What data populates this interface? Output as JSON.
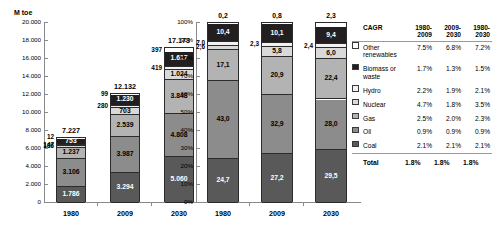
{
  "colors": {
    "other_renewables": "#ffffff",
    "biomass": "#231f20",
    "hydro": "#f2f2f2",
    "nuclear": "#d9d9d9",
    "gas": "#b3b3b3",
    "oil": "#8c8c8c",
    "coal": "#595959",
    "axis": "#8a8a8a",
    "outline": "#2b2b2b"
  },
  "chart_data": [
    {
      "type": "bar",
      "id": "absolute-stacked-bar",
      "title": "",
      "ylabel": "M toe",
      "xlabel": "",
      "categories": [
        "1980",
        "2009",
        "2030"
      ],
      "ylim": [
        0,
        20000
      ],
      "ytick_labels": [
        "0",
        "2.000",
        "4.000",
        "6.000",
        "8.000",
        "10.000",
        "12.000",
        "14.000",
        "16.000",
        "18.000",
        "20.000"
      ],
      "ytick_values": [
        0,
        2000,
        4000,
        6000,
        8000,
        10000,
        12000,
        14000,
        16000,
        18000,
        20000
      ],
      "grid": false,
      "legend": "external-table",
      "stack_order_bottom_to_top": [
        "Coal",
        "Oil",
        "Gas",
        "Nuclear",
        "Hydro",
        "Biomass or waste",
        "Other renewables"
      ],
      "series": [
        {
          "name": "Coal",
          "values": [
            1786,
            3294,
            5060
          ],
          "labels": [
            "1.786",
            "3.294",
            "5.060"
          ],
          "label_pos": [
            "inside",
            "inside",
            "inside"
          ]
        },
        {
          "name": "Oil",
          "values": [
            3106,
            3987,
            4808
          ],
          "labels": [
            "3.106",
            "3.987",
            "4.808"
          ],
          "label_pos": [
            "inside",
            "inside",
            "inside"
          ]
        },
        {
          "name": "Gas",
          "values": [
            1237,
            2539,
            3848
          ],
          "labels": [
            "1.237",
            "2.539",
            "3.848"
          ],
          "label_pos": [
            "inside",
            "inside",
            "inside"
          ]
        },
        {
          "name": "Nuclear",
          "values": [
            186,
            703,
            1024
          ],
          "labels": [
            "186",
            "703",
            "1.024"
          ],
          "label_pos": [
            "outside",
            "inside",
            "inside"
          ]
        },
        {
          "name": "Hydro",
          "values": [
            147,
            280,
            419
          ],
          "labels": [
            "147",
            "280",
            "419"
          ],
          "label_pos": [
            "outside",
            "outside",
            "outside"
          ]
        },
        {
          "name": "Biomass or waste",
          "values": [
            753,
            1230,
            1617
          ],
          "labels": [
            "753",
            "1.230",
            "1.617"
          ],
          "label_pos": [
            "inside",
            "inside",
            "inside"
          ]
        },
        {
          "name": "Other renewables",
          "values": [
            12,
            99,
            397
          ],
          "labels": [
            "12",
            "99",
            "397"
          ],
          "label_pos": [
            "outside",
            "outside",
            "outside"
          ]
        }
      ],
      "totals": [
        7227,
        12132,
        17173
      ],
      "total_labels": [
        "7.227",
        "12.132",
        "17.173"
      ]
    },
    {
      "type": "bar",
      "id": "percent-stacked-bar",
      "title": "",
      "ylabel": "",
      "xlabel": "",
      "categories": [
        "1980",
        "2009",
        "2030"
      ],
      "ylim": [
        0,
        100
      ],
      "ytick_labels": [
        "0%",
        "10%",
        "20%",
        "30%",
        "40%",
        "50%",
        "60%",
        "70%",
        "80%",
        "90%",
        "100%"
      ],
      "ytick_values": [
        0,
        10,
        20,
        30,
        40,
        50,
        60,
        70,
        80,
        90,
        100
      ],
      "grid": false,
      "legend": "external-table",
      "stack_order_bottom_to_top": [
        "Coal",
        "Oil",
        "Gas",
        "Nuclear",
        "Hydro",
        "Biomass or waste",
        "Other renewables"
      ],
      "series": [
        {
          "name": "Coal",
          "values": [
            24.7,
            27.2,
            29.5
          ],
          "labels": [
            "24,7",
            "27,2",
            "29,5"
          ],
          "label_pos": [
            "inside",
            "inside",
            "inside"
          ]
        },
        {
          "name": "Oil",
          "values": [
            43.0,
            32.9,
            28.0
          ],
          "labels": [
            "43,0",
            "32,9",
            "28,0"
          ],
          "label_pos": [
            "inside",
            "inside",
            "inside"
          ]
        },
        {
          "name": "Gas",
          "values": [
            17.1,
            20.9,
            22.4
          ],
          "labels": [
            "17,1",
            "20,9",
            "22,4"
          ],
          "label_pos": [
            "inside",
            "inside",
            "inside"
          ]
        },
        {
          "name": "Nuclear",
          "values": [
            2.6,
            5.8,
            6.0
          ],
          "labels": [
            "2,6",
            "5,8",
            "6,0"
          ],
          "label_pos": [
            "outside",
            "inside",
            "inside"
          ]
        },
        {
          "name": "Hydro",
          "values": [
            2.0,
            2.3,
            2.4
          ],
          "labels": [
            "2,0",
            "2,3",
            "2,4"
          ],
          "label_pos": [
            "outside",
            "outside",
            "outside"
          ]
        },
        {
          "name": "Biomass or waste",
          "values": [
            10.4,
            10.1,
            9.4
          ],
          "labels": [
            "10,4",
            "10,1",
            "9,4"
          ],
          "label_pos": [
            "inside",
            "inside",
            "inside"
          ]
        },
        {
          "name": "Other renewables",
          "values": [
            0.2,
            0.8,
            2.3
          ],
          "labels": [
            "0,2",
            "0,8",
            "2,3"
          ],
          "label_pos": [
            "top",
            "top",
            "top"
          ]
        }
      ],
      "totals": [
        100,
        100,
        100
      ],
      "total_labels": [
        "",
        "",
        ""
      ]
    }
  ],
  "legend_table": {
    "corner_label": "CAGR",
    "columns": [
      "1980-\n2009",
      "2009-\n2030",
      "1980-\n2030"
    ],
    "columns_parts": [
      {
        "top": "1980-",
        "bottom": "2009"
      },
      {
        "top": "2009-",
        "bottom": "2030"
      },
      {
        "top": "1980-",
        "bottom": "2030"
      }
    ],
    "rows": [
      {
        "label": "Other renewables",
        "swatch": "other_renewables",
        "values": [
          "7.5%",
          "6.8%",
          "7.2%"
        ]
      },
      {
        "label": "Biomass or waste",
        "swatch": "biomass",
        "values": [
          "1.7%",
          "1.3%",
          "1.5%"
        ]
      },
      {
        "label": "Hydro",
        "swatch": "hydro",
        "values": [
          "2.2%",
          "1.9%",
          "2.1%"
        ]
      },
      {
        "label": "Nuclear",
        "swatch": "nuclear",
        "values": [
          "4.7%",
          "1.8%",
          "3.5%"
        ]
      },
      {
        "label": "Gas",
        "swatch": "gas",
        "values": [
          "2.5%",
          "2.0%",
          "2.3%"
        ]
      },
      {
        "label": "Oil",
        "swatch": "oil",
        "values": [
          "0.9%",
          "0.9%",
          "0.9%"
        ]
      },
      {
        "label": "Coal",
        "swatch": "coal",
        "values": [
          "2.1%",
          "2.1%",
          "2.1%"
        ]
      }
    ],
    "total_row": {
      "label": "Total",
      "values": [
        "1.8%",
        "1.8%",
        "1.8%"
      ]
    }
  }
}
